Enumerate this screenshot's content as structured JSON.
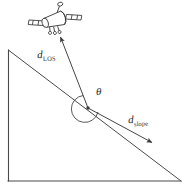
{
  "figure": {
    "background_color": "#ffffff",
    "stroke_color": "#3a3a3a",
    "width": 189,
    "height": 189
  },
  "labels": {
    "d_los": {
      "variable": "d",
      "subscript": "LOS"
    },
    "d_slope": {
      "variable": "d",
      "subscript": "slope"
    },
    "theta": "θ"
  },
  "objects": {
    "satellite": {
      "name": "satellite",
      "center_x": 55,
      "center_y": 20
    },
    "terrain_triangle": {
      "name": "slope-triangle",
      "apex": [
        8,
        50
      ],
      "bottom_left": [
        8,
        181
      ],
      "bottom_right": [
        180,
        181
      ]
    },
    "origin_point": {
      "name": "measurement-origin",
      "x": 88,
      "y": 108
    }
  },
  "vectors": [
    {
      "name": "d-los-vector",
      "label": "d_LOS",
      "from": [
        88,
        108
      ],
      "to": [
        60,
        36
      ],
      "direction": "up-left toward satellite"
    },
    {
      "name": "d-slope-vector",
      "label": "d_slope",
      "from": [
        88,
        108
      ],
      "to": [
        153,
        143
      ],
      "direction": "down-right along slope"
    }
  ],
  "angle": {
    "name": "theta-angle",
    "symbol": "θ",
    "vertex": [
      88,
      108
    ],
    "between": [
      "d_LOS",
      "d_slope"
    ]
  }
}
